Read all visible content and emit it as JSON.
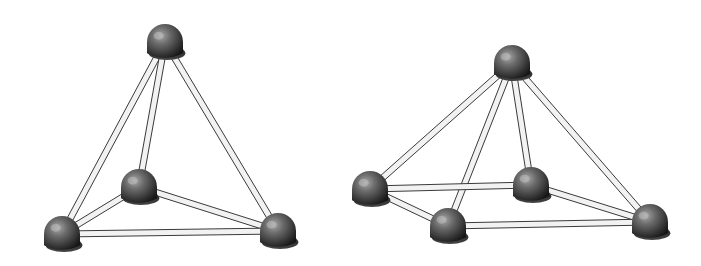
{
  "figures": [
    {
      "name": "tetrahedron",
      "atoms": [
        {
          "id": "top",
          "x": 165,
          "y": 42
        },
        {
          "id": "back",
          "x": 139,
          "y": 187
        },
        {
          "id": "bottom-left",
          "x": 62,
          "y": 234
        },
        {
          "id": "bottom-right",
          "x": 278,
          "y": 231
        }
      ],
      "bonds": [
        [
          "top",
          "bottom-left"
        ],
        [
          "top",
          "bottom-right"
        ],
        [
          "top",
          "back"
        ],
        [
          "back",
          "bottom-left"
        ],
        [
          "back",
          "bottom-right"
        ],
        [
          "bottom-left",
          "bottom-right"
        ]
      ]
    },
    {
      "name": "square-pyramid",
      "atoms": [
        {
          "id": "apex",
          "x": 512,
          "y": 63
        },
        {
          "id": "left",
          "x": 370,
          "y": 189
        },
        {
          "id": "front",
          "x": 448,
          "y": 226
        },
        {
          "id": "back",
          "x": 531,
          "y": 185
        },
        {
          "id": "right",
          "x": 650,
          "y": 222
        }
      ],
      "bonds": [
        [
          "apex",
          "left"
        ],
        [
          "apex",
          "front"
        ],
        [
          "apex",
          "back"
        ],
        [
          "apex",
          "right"
        ],
        [
          "left",
          "back"
        ],
        [
          "left",
          "front"
        ],
        [
          "front",
          "right"
        ],
        [
          "back",
          "right"
        ]
      ]
    }
  ],
  "style": {
    "atom_radius": 18,
    "rod_width": 6,
    "rod_fill": "#f2f2f2",
    "rod_stroke": "#3a3a3a",
    "atom_dark": "#1c1c1c",
    "atom_mid": "#555555",
    "atom_light": "#9a9a9a"
  }
}
